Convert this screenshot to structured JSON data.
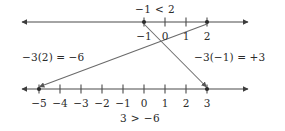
{
  "figure": {
    "kind": "number-line-inequality-diagram",
    "width": 285,
    "height": 131,
    "background_color": "#ffffff",
    "line_color": "#4a4a4a",
    "text_color": "#2b2b2b"
  },
  "top_inequality": {
    "text": "−1 < 2",
    "x": 155,
    "y": 9
  },
  "bottom_inequality": {
    "text": "3 > −6",
    "x": 140,
    "y": 118
  },
  "left_expression": {
    "text": "−3(2) = −6",
    "x": 22,
    "y": 57
  },
  "right_expression": {
    "text": "−3(−1) = +3",
    "x": 194,
    "y": 57
  },
  "top_line": {
    "axis_y": 22,
    "x_start": 20,
    "x_end": 250,
    "label_y": 31,
    "ticks": [
      {
        "label": "−1",
        "x": 144,
        "marked": true
      },
      {
        "label": "0",
        "x": 165,
        "marked": false
      },
      {
        "label": "1",
        "x": 186,
        "marked": false
      },
      {
        "label": "2",
        "x": 207,
        "marked": true
      }
    ]
  },
  "bottom_line": {
    "axis_y": 89,
    "x_start": 20,
    "x_end": 250,
    "label_y": 98,
    "ticks": [
      {
        "label": "−5",
        "x": 39,
        "marked": true
      },
      {
        "label": "−4",
        "x": 60,
        "marked": false
      },
      {
        "label": "−3",
        "x": 81,
        "marked": false
      },
      {
        "label": "−2",
        "x": 102,
        "marked": false
      },
      {
        "label": "−1",
        "x": 123,
        "marked": false
      },
      {
        "label": "0",
        "x": 144,
        "marked": false
      },
      {
        "label": "1",
        "x": 165,
        "marked": false
      },
      {
        "label": "2",
        "x": 186,
        "marked": false
      },
      {
        "label": "3",
        "x": 207,
        "marked": true
      }
    ]
  },
  "mapping_arrows": [
    {
      "name": "neg-one-to-three",
      "from_label": "−1",
      "to_label": "3",
      "x1": 144,
      "y1": 24,
      "x2": 226,
      "y2": 87
    },
    {
      "name": "two-to-negative-five",
      "from_label": "2",
      "to_label": "−5",
      "x1": 207,
      "y1": 24,
      "x2": 41,
      "y2": 87
    }
  ]
}
